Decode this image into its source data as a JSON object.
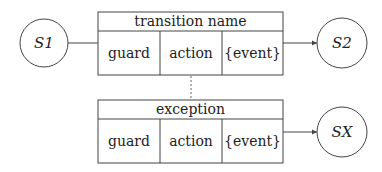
{
  "states": {
    "s1": {
      "label": "S1"
    },
    "s2": {
      "label": "S2"
    },
    "sx": {
      "label": "SX"
    }
  },
  "transition": {
    "title": "transition name",
    "cells": [
      "guard",
      "action",
      "{event}"
    ]
  },
  "exception": {
    "title": "exception",
    "cells": [
      "guard",
      "action",
      "{event}"
    ]
  },
  "colors": {
    "stroke": "#444444",
    "text": "#222222",
    "background": "#ffffff"
  }
}
